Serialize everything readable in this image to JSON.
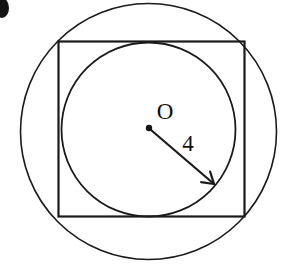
{
  "figure": {
    "background_color": "#ffffff",
    "stroke_color": "#1a1a1a",
    "text_color": "#111111",
    "canvas": {
      "width": 291,
      "height": 265
    },
    "labels": {
      "center_label": "O",
      "radius_label": "4"
    },
    "shapes": {
      "outer_circle": {
        "name": "circumscribed-circle",
        "cx": 148.5,
        "cy": 131.5,
        "r": 128,
        "stroke_width": 1.6
      },
      "square": {
        "name": "square",
        "x": 58.5,
        "y": 41.5,
        "width": 186,
        "height": 175,
        "stroke_width": 2.2
      },
      "inner_circle": {
        "name": "inscribed-circle",
        "cx": 148.5,
        "cy": 129.5,
        "r": 87,
        "stroke_width": 1.8
      },
      "center_dot": {
        "name": "center-point",
        "cx": 149,
        "cy": 128,
        "r": 3.2
      },
      "radius_arrow": {
        "name": "radius-arrow",
        "x1": 151,
        "y1": 130,
        "x2": 214,
        "y2": 184,
        "stroke_width": 2.2,
        "head_length": 13,
        "head_angle_deg": 32
      },
      "corner_mark": {
        "name": "cropped-bullet-mark",
        "cx": 2,
        "cy": 8,
        "rx": 7,
        "ry": 10
      }
    },
    "label_positions": {
      "center_label": {
        "x": 165,
        "y": 119,
        "font_size": 23
      },
      "radius_label": {
        "x": 188,
        "y": 151,
        "font_size": 23
      }
    }
  }
}
